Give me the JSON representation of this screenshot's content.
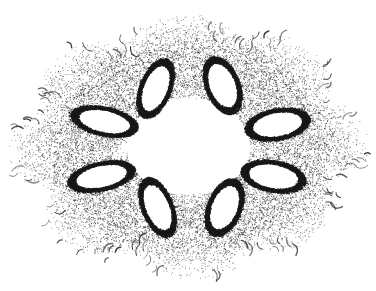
{
  "figure": {
    "title": "Siegel disk Julia set with eight-fold symmetry",
    "caption": "",
    "kind": "fractal-point-cloud",
    "background_color": "#ffffff",
    "ink_color": "#1a1a1a",
    "width": 376,
    "height": 291
  },
  "chart_data": {
    "type": "scatter",
    "title": "Siegel disk Julia set with eight-fold symmetry",
    "xlabel": "",
    "ylabel": "",
    "xlim": [
      0,
      376
    ],
    "ylim": [
      0,
      291
    ],
    "grid": false,
    "legend": "none",
    "axes_visible": false,
    "symmetry_order": 8,
    "center": [
      188,
      146
    ],
    "central_void": {
      "shape": "ellipse",
      "cx": 188,
      "cy": 146,
      "rx": 62,
      "ry": 48,
      "fill": "#ffffff"
    },
    "outer_extent": {
      "rx": 178,
      "ry": 132
    },
    "point_color": "#1a1a1a",
    "point_count_estimate": 26000,
    "holes": [
      {
        "name": "hole-top-left",
        "cx": 155,
        "cy": 88,
        "rx": 12,
        "ry": 24,
        "angle_deg": 22,
        "rim_thickness": 4
      },
      {
        "name": "hole-top-right",
        "cx": 222,
        "cy": 85,
        "rx": 13,
        "ry": 23,
        "angle_deg": -22,
        "rim_thickness": 4
      },
      {
        "name": "hole-mid-right",
        "cx": 277,
        "cy": 124,
        "rx": 25,
        "ry": 12,
        "angle_deg": -10,
        "rim_thickness": 4
      },
      {
        "name": "hole-low-right",
        "cx": 273,
        "cy": 176,
        "rx": 25,
        "ry": 12,
        "angle_deg": 10,
        "rim_thickness": 4
      },
      {
        "name": "hole-bottom-right",
        "cx": 224,
        "cy": 207,
        "rx": 13,
        "ry": 23,
        "angle_deg": 22,
        "rim_thickness": 4
      },
      {
        "name": "hole-bottom-left",
        "cx": 157,
        "cy": 207,
        "rx": 12,
        "ry": 24,
        "angle_deg": -22,
        "rim_thickness": 4
      },
      {
        "name": "hole-low-left",
        "cx": 101,
        "cy": 176,
        "rx": 26,
        "ry": 11,
        "angle_deg": -12,
        "rim_thickness": 4
      },
      {
        "name": "hole-mid-left",
        "cx": 104,
        "cy": 121,
        "rx": 26,
        "ry": 11,
        "angle_deg": 12,
        "rim_thickness": 4
      }
    ],
    "hook_strokes": {
      "description": "comma shaped curved strokes fringing the outer boundary",
      "count": 150,
      "length_px": 9,
      "color": "#2b2b2b"
    },
    "density_profile": {
      "inner_edge": "dense dark rim around each white hole",
      "mid_field": "medium stipple",
      "outer_edge": "sparse stipple fading to isolated comma hooks"
    }
  }
}
